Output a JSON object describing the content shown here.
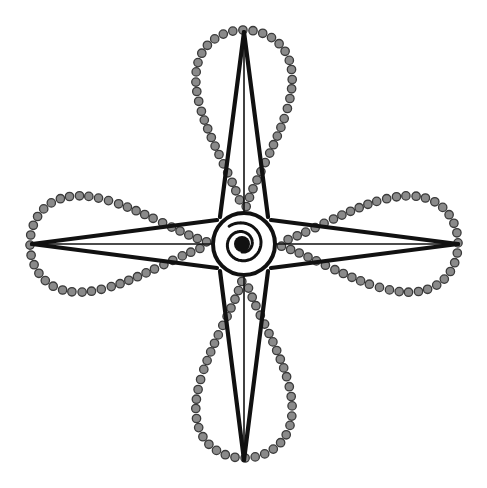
{
  "diagram": {
    "title": "",
    "type": "ornamental-compass-star",
    "center": {
      "x": 244,
      "y": 244
    },
    "center_circle_radius": 31,
    "spiral": {
      "outer_radius": 22,
      "core_radius": 8
    },
    "arm_length": 212,
    "arms": [
      {
        "direction": "north",
        "tip": {
          "x": 244,
          "y": 32
        }
      },
      {
        "direction": "east",
        "tip": {
          "x": 458,
          "y": 244
        }
      },
      {
        "direction": "south",
        "tip": {
          "x": 244,
          "y": 460
        }
      },
      {
        "direction": "west",
        "tip": {
          "x": 32,
          "y": 244
        }
      }
    ],
    "petals": [
      {
        "direction": "north"
      },
      {
        "direction": "east"
      },
      {
        "direction": "south"
      },
      {
        "direction": "west"
      }
    ],
    "colors": {
      "background": "#ffffff",
      "line": "#111111",
      "bead_fill": "#8a8a8a",
      "bead_stroke": "#3a3a3a"
    }
  }
}
